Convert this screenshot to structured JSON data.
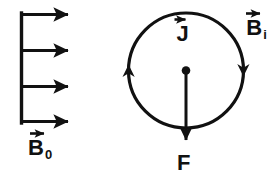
{
  "figure": {
    "background_color": "#ffffff",
    "ink_color": "#111111",
    "width": 277,
    "height": 189
  },
  "left_diagram": {
    "name": "uniform-field-arrows",
    "description": "Four parallel arrows pointing right, joined by a vertical spine on the left",
    "arrow_count": 4,
    "arrow_direction": "right",
    "label": {
      "symbol": "B",
      "subscript": "0",
      "has_vector_arrow": true,
      "arrow_direction": "right",
      "full_text": "B0"
    }
  },
  "right_diagram": {
    "name": "current-loop",
    "description": "Circle representing a current loop with counterclockwise circulation arrowheads, a center dot, and a downward force arrow",
    "circulation": "counterclockwise",
    "left_arrowhead_direction": "up",
    "right_arrowhead_direction": "down",
    "center_dot": true,
    "current_label": {
      "symbol": "J",
      "subscript": "",
      "has_vector_arrow": true,
      "arrow_direction": "right",
      "full_text": "J"
    },
    "induced_field_label": {
      "symbol": "B",
      "subscript": "i",
      "has_vector_arrow": true,
      "arrow_direction": "right",
      "full_text": "Bi"
    },
    "force_label": {
      "symbol": "F",
      "subscript": "",
      "has_vector_arrow": false,
      "arrow_direction": "down",
      "full_text": "F"
    }
  }
}
